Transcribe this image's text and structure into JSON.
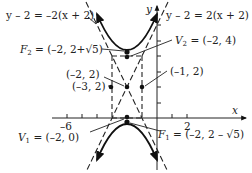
{
  "diagram": {
    "type": "hyperbola-graph",
    "axes": {
      "x_label": "x",
      "y_label": "y",
      "x_tick_labels": [
        {
          "value": -6,
          "text": "–6"
        },
        {
          "value": 2,
          "text": "2"
        }
      ]
    },
    "asymptotes": [
      {
        "text": "y – 2 = –2(x + 2)"
      },
      {
        "text": "y – 2 = 2(x + 2)"
      }
    ],
    "points": [
      {
        "name": "F2",
        "text_prefix": "F",
        "sub": "2",
        "text_suffix": " = (–2, 2+√5)"
      },
      {
        "name": "V2",
        "text_prefix": "V",
        "sub": "2",
        "text_suffix": " = (–2, 4)"
      },
      {
        "name": "center",
        "text": "(–2, 2)"
      },
      {
        "name": "left",
        "text": "(–3, 2)"
      },
      {
        "name": "right",
        "text": "(–1, 2)"
      },
      {
        "name": "V1",
        "text_prefix": "V",
        "sub": "1",
        "text_suffix": " = (–2, 0)"
      },
      {
        "name": "F1",
        "text_prefix": "F",
        "sub": "1",
        "text_suffix": " = (–2, 2 – √5)"
      }
    ]
  }
}
